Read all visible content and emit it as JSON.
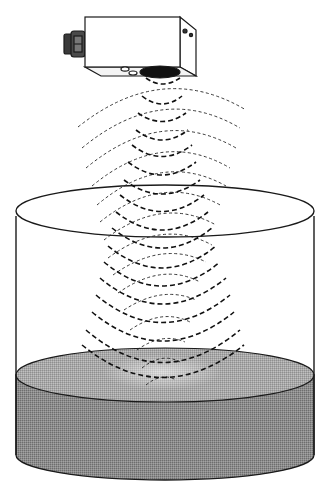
{
  "diagram": {
    "components": [
      {
        "id": "sensor",
        "label": "Ultrasonic sensor"
      },
      {
        "id": "connector",
        "label": "Cable connector"
      },
      {
        "id": "transducer",
        "label": "Transducer face"
      },
      {
        "id": "emitted-waves",
        "label": "Emitted sound waves"
      },
      {
        "id": "reflected-waves",
        "label": "Reflected echo waves"
      },
      {
        "id": "tank",
        "label": "Open cylindrical tank"
      },
      {
        "id": "liquid",
        "label": "Liquid"
      }
    ],
    "colors": {
      "ink": "#1a1a1a",
      "liquid_top": "#9a9a9a",
      "liquid_side": "#7a7a7a",
      "transducer": "#111111",
      "background": "#ffffff"
    }
  }
}
